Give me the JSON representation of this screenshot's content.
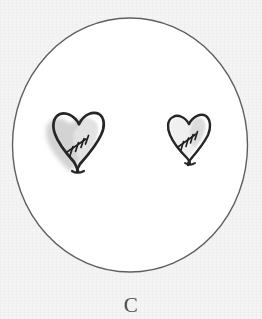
{
  "figure": {
    "background_color": "#f4f4f4",
    "ink_color": "#2b2b2b",
    "outline_color": "#5a5a5a",
    "shade_color": "#d6d6d6",
    "fill_color": "#ffffff",
    "style": "hand-drawn-sketch"
  },
  "circle": {
    "name": "enclosing-circle",
    "center_x": 130,
    "center_y": 145,
    "radius_x": 118,
    "radius_y": 127,
    "stroke_width": 1.4,
    "stroke_color": "#5a5a5a",
    "fill_color": "#ffffff"
  },
  "hearts": [
    {
      "id": "heart-left",
      "label": "shaded stitched heart",
      "center_x": 78,
      "center_y": 142,
      "width": 52,
      "height": 60,
      "shaded": true,
      "shade_color": "#d4d4d4",
      "shade_offset_x": -4,
      "shade_offset_y": 3,
      "outline_color": "#262626",
      "outline_width": 2.6,
      "stitch_marks": 4,
      "stitch_label": "scar-stitches"
    },
    {
      "id": "heart-right",
      "label": "plain stitched heart",
      "center_x": 188,
      "center_y": 138,
      "width": 42,
      "height": 48,
      "shaded": false,
      "shade_color": "#ffffff",
      "shade_offset_x": 0,
      "shade_offset_y": 0,
      "outline_color": "#262626",
      "outline_width": 2.3,
      "stitch_marks": 4,
      "stitch_label": "scar-stitches"
    }
  ],
  "caption": {
    "text": "C",
    "cropped": true,
    "position": "bottom-center"
  }
}
